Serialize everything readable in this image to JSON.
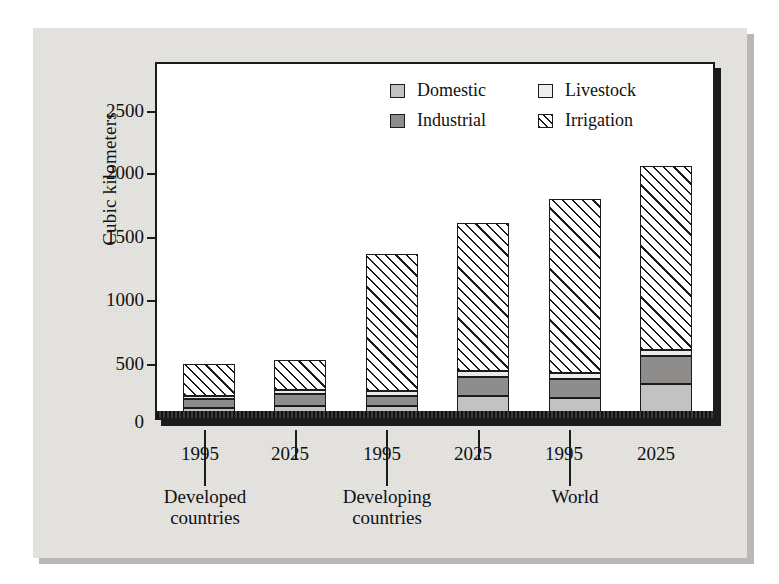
{
  "chart_data": {
    "type": "bar",
    "subtype": "stacked",
    "title": "",
    "xlabel": "",
    "ylabel": "Cubic kilometers",
    "ylim": [
      0,
      2750
    ],
    "yticks": [
      0,
      500,
      1000,
      1500,
      2000,
      2500
    ],
    "ytick_labels": [
      "0",
      "500",
      "1000",
      "1500",
      "2000",
      "2500"
    ],
    "grid": false,
    "legend_position": "top-right",
    "categories": [
      "1995",
      "2025",
      "1995",
      "2025",
      "1995",
      "2025"
    ],
    "groups": [
      {
        "label_line1": "Developed",
        "label_line2": "countries",
        "categories": [
          "1995",
          "2025"
        ]
      },
      {
        "label_line1": "Developing",
        "label_line2": "countries",
        "categories": [
          "1995",
          "2025"
        ]
      },
      {
        "label_line1": "World",
        "label_line2": "",
        "categories": [
          "1995",
          "2025"
        ]
      }
    ],
    "series": [
      {
        "name": "Domestic",
        "color": "#c3c2c0",
        "pattern": "solid",
        "values": [
          90,
          110,
          105,
          185,
          175,
          285
        ]
      },
      {
        "name": "Industrial",
        "color": "#8e8d8b",
        "pattern": "solid",
        "values": [
          70,
          95,
          80,
          155,
          155,
          230
        ]
      },
      {
        "name": "Livestock",
        "color": "#ecebe9",
        "pattern": "solid",
        "values": [
          30,
          35,
          45,
          50,
          50,
          50
        ]
      },
      {
        "name": "Irrigation",
        "color": "#ffffff",
        "pattern": "diagonal-hatch",
        "values": [
          260,
          245,
          1115,
          1210,
          1415,
          1500
        ]
      }
    ],
    "totals": [
      450,
      485,
      1345,
      1600,
      1795,
      2065
    ],
    "bars": [
      {
        "group": "Developed countries",
        "category": "1995",
        "Domestic": 90,
        "Industrial": 70,
        "Livestock": 30,
        "Irrigation": 260,
        "total": 450
      },
      {
        "group": "Developed countries",
        "category": "2025",
        "Domestic": 110,
        "Industrial": 95,
        "Livestock": 35,
        "Irrigation": 245,
        "total": 485
      },
      {
        "group": "Developing countries",
        "category": "1995",
        "Domestic": 105,
        "Industrial": 80,
        "Livestock": 45,
        "Irrigation": 1115,
        "total": 1345
      },
      {
        "group": "Developing countries",
        "category": "2025",
        "Domestic": 185,
        "Industrial": 155,
        "Livestock": 50,
        "Irrigation": 1210,
        "total": 1600
      },
      {
        "group": "World",
        "category": "1995",
        "Domestic": 175,
        "Industrial": 155,
        "Livestock": 50,
        "Irrigation": 1415,
        "total": 1795
      },
      {
        "group": "World",
        "category": "2025",
        "Domestic": 285,
        "Industrial": 230,
        "Livestock": 50,
        "Irrigation": 1500,
        "total": 2065
      }
    ]
  },
  "legend": {
    "entries": [
      {
        "label": "Domestic",
        "swatch": "domestic"
      },
      {
        "label": "Livestock",
        "swatch": "livestock"
      },
      {
        "label": "Industrial",
        "swatch": "industrial"
      },
      {
        "label": "Irrigation",
        "swatch": "irrigation"
      }
    ]
  },
  "axis": {
    "y_title": "Cubic kilometers",
    "y_ticks": [
      "2500",
      "2000",
      "1500",
      "1000",
      "500",
      "0"
    ]
  },
  "xaxis": {
    "ticks": [
      "1995",
      "2025",
      "1995",
      "2025",
      "1995",
      "2025"
    ],
    "group_labels": [
      {
        "line1": "Developed",
        "line2": "countries"
      },
      {
        "line1": "Developing",
        "line2": "countries"
      },
      {
        "line1": "World",
        "line2": ""
      }
    ]
  },
  "colors": {
    "domestic": "#c3c2c0",
    "industrial": "#8e8d8b",
    "livestock": "#ecebe9",
    "irrigation_hatch": "#1b1b1b",
    "outline": "#1b1b1b",
    "paper": "#e8e7e4",
    "plot_background": "#ffffff"
  }
}
